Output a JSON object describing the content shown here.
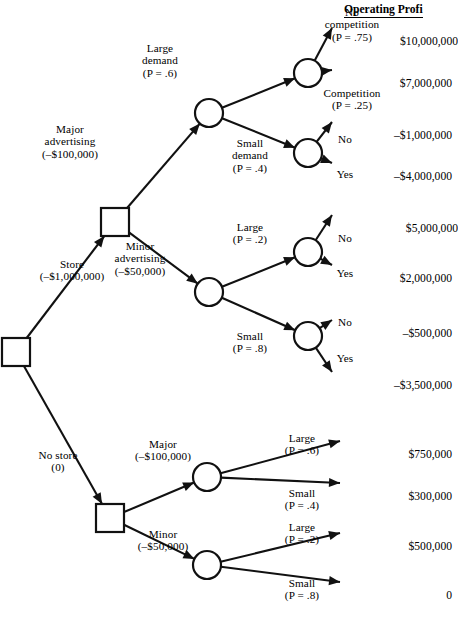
{
  "diagram": {
    "header": {
      "label": "Operating Profi",
      "full_label": "Operating Profit"
    },
    "colors": {
      "stroke": "#111111",
      "fill": "#ffffff",
      "background": "#ffffff"
    },
    "nodes": [
      {
        "id": "root",
        "type": "decision",
        "x": 16,
        "y": 352,
        "name": "root-decision-node"
      },
      {
        "id": "adv",
        "type": "decision",
        "x": 115,
        "y": 222,
        "name": "advertising-decision-node"
      },
      {
        "id": "nostore-adv",
        "type": "decision",
        "x": 110,
        "y": 518,
        "name": "no-store-advertising-decision-node"
      },
      {
        "id": "major-dem",
        "type": "chance",
        "x": 209,
        "y": 113,
        "name": "major-demand-chance-node"
      },
      {
        "id": "minor-dem",
        "type": "chance",
        "x": 209,
        "y": 292,
        "name": "minor-demand-chance-node"
      },
      {
        "id": "lg-comp",
        "type": "chance",
        "x": 308,
        "y": 73,
        "name": "large-demand-competition-chance-node"
      },
      {
        "id": "sm-comp",
        "type": "chance",
        "x": 308,
        "y": 153,
        "name": "small-demand-competition-chance-node"
      },
      {
        "id": "lg2-comp",
        "type": "chance",
        "x": 308,
        "y": 252,
        "name": "minor-large-competition-chance-node"
      },
      {
        "id": "sm2-comp",
        "type": "chance",
        "x": 308,
        "y": 336,
        "name": "minor-small-competition-chance-node"
      },
      {
        "id": "ns-major",
        "type": "chance",
        "x": 207,
        "y": 477,
        "name": "no-store-major-chance-node"
      },
      {
        "id": "ns-minor",
        "type": "chance",
        "x": 207,
        "y": 565,
        "name": "no-store-minor-chance-node"
      }
    ],
    "branch_labels": [
      {
        "id": "store",
        "name": "branch-label-store",
        "lines": [
          "Store",
          "(–$1,000,000)"
        ],
        "x": 72,
        "y": 258,
        "align": "center"
      },
      {
        "id": "nostore",
        "name": "branch-label-no-store",
        "lines": [
          "No store",
          "(0)"
        ],
        "x": 58,
        "y": 449,
        "align": "center"
      },
      {
        "id": "majoradv",
        "name": "branch-label-major-advertising",
        "lines": [
          "Major",
          "advertising",
          "(–$100,000)"
        ],
        "x": 70,
        "y": 123,
        "align": "center"
      },
      {
        "id": "minoradv",
        "name": "branch-label-minor-advertising",
        "lines": [
          "Minor",
          "advertising",
          "(–$50,000)"
        ],
        "x": 140,
        "y": 240,
        "align": "center"
      },
      {
        "id": "lgdem",
        "name": "branch-label-large-demand",
        "lines": [
          "Large",
          "demand",
          "(P = .6)"
        ],
        "x": 160,
        "y": 42,
        "align": "center"
      },
      {
        "id": "smdem",
        "name": "branch-label-small-demand",
        "lines": [
          "Small",
          "demand",
          "(P = .4)"
        ],
        "x": 250,
        "y": 137,
        "align": "center"
      },
      {
        "id": "lg2",
        "name": "branch-label-large-p2",
        "lines": [
          "Large",
          "(P = .2)"
        ],
        "x": 250,
        "y": 221,
        "align": "center"
      },
      {
        "id": "sm2",
        "name": "branch-label-small-p8",
        "lines": [
          "Small",
          "(P = .8)"
        ],
        "x": 250,
        "y": 330,
        "align": "center"
      },
      {
        "id": "nocomp",
        "name": "branch-label-no-competition",
        "lines": [
          "No",
          "competition",
          "(P = .75)"
        ],
        "x": 352,
        "y": 6,
        "align": "center"
      },
      {
        "id": "comp",
        "name": "branch-label-competition",
        "lines": [
          "Competition",
          "(P = .25)"
        ],
        "x": 352,
        "y": 87,
        "align": "center"
      },
      {
        "id": "no1",
        "name": "branch-label-no-1",
        "lines": [
          "No"
        ],
        "x": 345,
        "y": 133,
        "align": "center"
      },
      {
        "id": "yes1",
        "name": "branch-label-yes-1",
        "lines": [
          "Yes"
        ],
        "x": 345,
        "y": 168,
        "align": "center"
      },
      {
        "id": "no2",
        "name": "branch-label-no-2",
        "lines": [
          "No"
        ],
        "x": 345,
        "y": 232,
        "align": "center"
      },
      {
        "id": "yes2",
        "name": "branch-label-yes-2",
        "lines": [
          "Yes"
        ],
        "x": 345,
        "y": 267,
        "align": "center"
      },
      {
        "id": "no3",
        "name": "branch-label-no-3",
        "lines": [
          "No"
        ],
        "x": 345,
        "y": 316,
        "align": "center"
      },
      {
        "id": "yes3",
        "name": "branch-label-yes-3",
        "lines": [
          "Yes"
        ],
        "x": 345,
        "y": 352,
        "align": "center"
      },
      {
        "id": "nsmajor",
        "name": "branch-label-ns-major",
        "lines": [
          "Major",
          "(–$100,000)"
        ],
        "x": 163,
        "y": 438,
        "align": "center"
      },
      {
        "id": "nsminor",
        "name": "branch-label-ns-minor",
        "lines": [
          "Minor",
          "(–$50,000)"
        ],
        "x": 163,
        "y": 528,
        "align": "center"
      },
      {
        "id": "nslg1",
        "name": "branch-label-ns-large-p6",
        "lines": [
          "Large",
          "(P = .6)"
        ],
        "x": 302,
        "y": 432,
        "align": "center"
      },
      {
        "id": "nssm1",
        "name": "branch-label-ns-small-p4",
        "lines": [
          "Small",
          "(P = .4)"
        ],
        "x": 302,
        "y": 487,
        "align": "center"
      },
      {
        "id": "nslg2",
        "name": "branch-label-ns-large-p2",
        "lines": [
          "Large",
          "(P = .2)"
        ],
        "x": 302,
        "y": 521,
        "align": "center"
      },
      {
        "id": "nssm2",
        "name": "branch-label-ns-small-p8",
        "lines": [
          "Small",
          "(P = .8)"
        ],
        "x": 302,
        "y": 577,
        "align": "center"
      }
    ],
    "payoffs": [
      {
        "id": "p1",
        "name": "payoff-10000000",
        "value": "$10,000,000",
        "x": 458,
        "y": 35
      },
      {
        "id": "p2",
        "name": "payoff-7000000",
        "value": "$7,000,000",
        "x": 452,
        "y": 77
      },
      {
        "id": "p3",
        "name": "payoff-neg1000000",
        "value": "–$1,000,000",
        "x": 452,
        "y": 129
      },
      {
        "id": "p4",
        "name": "payoff-neg4000000",
        "value": "–$4,000,000",
        "x": 452,
        "y": 170
      },
      {
        "id": "p5",
        "name": "payoff-5000000",
        "value": "$5,000,000",
        "x": 458,
        "y": 222
      },
      {
        "id": "p6",
        "name": "payoff-2000000",
        "value": "$2,000,000",
        "x": 452,
        "y": 272
      },
      {
        "id": "p7",
        "name": "payoff-neg500000",
        "value": "–$500,000",
        "x": 452,
        "y": 327
      },
      {
        "id": "p8",
        "name": "payoff-neg3500000",
        "value": "–$3,500,000",
        "x": 452,
        "y": 379
      },
      {
        "id": "p9",
        "name": "payoff-750000",
        "value": "$750,000",
        "x": 452,
        "y": 448
      },
      {
        "id": "p10",
        "name": "payoff-300000",
        "value": "$300,000",
        "x": 452,
        "y": 490
      },
      {
        "id": "p11",
        "name": "payoff-500000",
        "value": "$500,000",
        "x": 452,
        "y": 540
      },
      {
        "id": "p12",
        "name": "payoff-zero",
        "value": "0",
        "x": 452,
        "y": 589
      }
    ],
    "edges": [
      {
        "id": "e-store",
        "name": "edge-store",
        "from": "root",
        "to": "adv"
      },
      {
        "id": "e-nostore",
        "name": "edge-no-store",
        "from": "root",
        "to": "nostore-adv"
      },
      {
        "id": "e-majoradv",
        "name": "edge-major-advertising",
        "from": "adv",
        "to": "major-dem"
      },
      {
        "id": "e-minoradv",
        "name": "edge-minor-advertising",
        "from": "adv",
        "to": "minor-dem"
      },
      {
        "id": "e-lgdem",
        "name": "edge-large-demand",
        "from": "major-dem",
        "to": "lg-comp"
      },
      {
        "id": "e-smdem",
        "name": "edge-small-demand",
        "from": "major-dem",
        "to": "sm-comp"
      },
      {
        "id": "e-lg2",
        "name": "edge-minor-large",
        "from": "minor-dem",
        "to": "lg2-comp"
      },
      {
        "id": "e-sm2",
        "name": "edge-minor-small",
        "from": "minor-dem",
        "to": "sm2-comp"
      },
      {
        "id": "e-nsmajor",
        "name": "edge-ns-major",
        "from": "nostore-adv",
        "to": "ns-major"
      },
      {
        "id": "e-nsminor",
        "name": "edge-ns-minor",
        "from": "nostore-adv",
        "to": "ns-minor"
      }
    ],
    "chart_data": {
      "type": "tree",
      "title": "Decision tree for store and advertising decisions",
      "value_header": "Operating Profi",
      "structure": [
        {
          "decision": "Store",
          "cost": "–$1,000,000",
          "children": [
            {
              "decision": "Major advertising",
              "cost": "–$100,000",
              "children": [
                {
                  "event": "Large demand",
                  "probability": 0.6,
                  "children": [
                    {
                      "event": "No competition",
                      "probability": 0.75,
                      "payoff": "$10,000,000"
                    },
                    {
                      "event": "Competition",
                      "probability": 0.25,
                      "payoff": "$7,000,000"
                    }
                  ]
                },
                {
                  "event": "Small demand",
                  "probability": 0.4,
                  "children": [
                    {
                      "event": "No",
                      "payoff": "–$1,000,000"
                    },
                    {
                      "event": "Yes",
                      "payoff": "–$4,000,000"
                    }
                  ]
                }
              ]
            },
            {
              "decision": "Minor advertising",
              "cost": "–$50,000",
              "children": [
                {
                  "event": "Large",
                  "probability": 0.2,
                  "children": [
                    {
                      "event": "No",
                      "payoff": "$5,000,000"
                    },
                    {
                      "event": "Yes",
                      "payoff": "$2,000,000"
                    }
                  ]
                },
                {
                  "event": "Small",
                  "probability": 0.8,
                  "children": [
                    {
                      "event": "No",
                      "payoff": "–$500,000"
                    },
                    {
                      "event": "Yes",
                      "payoff": "–$3,500,000"
                    }
                  ]
                }
              ]
            }
          ]
        },
        {
          "decision": "No store",
          "cost": "(0)",
          "children": [
            {
              "decision": "Major",
              "cost": "–$100,000",
              "children": [
                {
                  "event": "Large",
                  "probability": 0.6,
                  "payoff": "$750,000"
                },
                {
                  "event": "Small",
                  "probability": 0.4,
                  "payoff": "$300,000"
                }
              ]
            },
            {
              "decision": "Minor",
              "cost": "–$50,000",
              "children": [
                {
                  "event": "Large",
                  "probability": 0.2,
                  "payoff": "$500,000"
                },
                {
                  "event": "Small",
                  "probability": 0.8,
                  "payoff": "0"
                }
              ]
            }
          ]
        }
      ]
    }
  }
}
